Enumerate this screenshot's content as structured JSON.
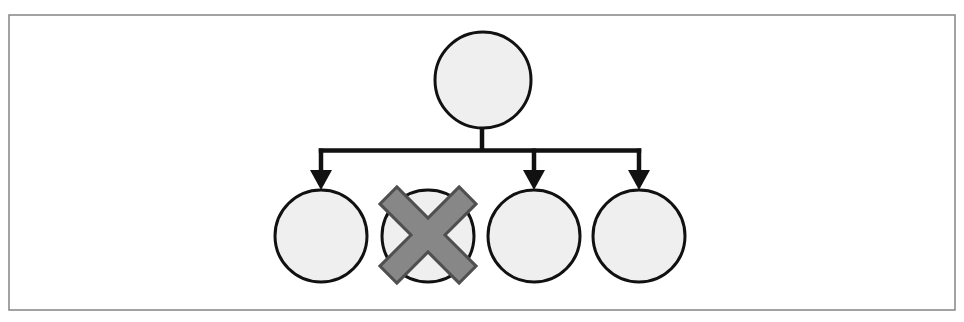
{
  "figure": {
    "title": "Tree diagram with one pruned child node",
    "kind": "node-link-tree",
    "frame": {
      "x": 9,
      "y": 15,
      "width": 946,
      "height": 295,
      "border_color": "#8c8c8c",
      "border_width": 1.6,
      "background": "#ffffff"
    },
    "canvas": {
      "width": 964,
      "height": 322,
      "background": "#ffffff"
    }
  },
  "style": {
    "node_fill": "#efefef",
    "node_stroke": "#111111",
    "node_stroke_width": 3,
    "edge_color": "#111111",
    "edge_width": 4.5,
    "cross_fill": "#878787",
    "cross_stroke": "#4f4f4f",
    "cross_stroke_width": 3
  },
  "nodes": {
    "root": {
      "id": "root",
      "label": "",
      "cx": 483,
      "cy": 80,
      "r": 48,
      "state": "active"
    },
    "children": [
      {
        "id": "child-1",
        "label": "",
        "cx": 321,
        "cy": 236,
        "r": 46,
        "state": "active",
        "has_arrow": true
      },
      {
        "id": "child-2",
        "label": "",
        "cx": 428,
        "cy": 236,
        "r": 46,
        "state": "pruned",
        "has_arrow": false
      },
      {
        "id": "child-3",
        "label": "",
        "cx": 534,
        "cy": 236,
        "r": 46,
        "state": "active",
        "has_arrow": true
      },
      {
        "id": "child-4",
        "label": "",
        "cx": 639,
        "cy": 236,
        "r": 46,
        "state": "active",
        "has_arrow": true
      }
    ]
  },
  "edges": {
    "stem": {
      "x": 482,
      "y_top": 126,
      "y_bottom": 151
    },
    "bus": {
      "y": 150,
      "x_left": 321,
      "x_right": 639
    },
    "drops": [
      {
        "x": 321,
        "y_top": 150,
        "y_tip": 190
      },
      {
        "x": 534,
        "y_top": 150,
        "y_tip": 190
      },
      {
        "x": 639,
        "y_top": 150,
        "y_tip": 190
      }
    ],
    "arrow_head": {
      "half_width": 11,
      "length": 20
    }
  },
  "markers": {
    "cross": {
      "name": "pruned-marker",
      "target_node": "child-2",
      "cx": 428,
      "cy": 235,
      "arm_length": 56,
      "arm_thickness": 24,
      "rotation_deg": 45
    }
  },
  "counts": {
    "total_nodes": 5,
    "children": 4,
    "pruned_children": 1,
    "active_arrows": 3
  }
}
